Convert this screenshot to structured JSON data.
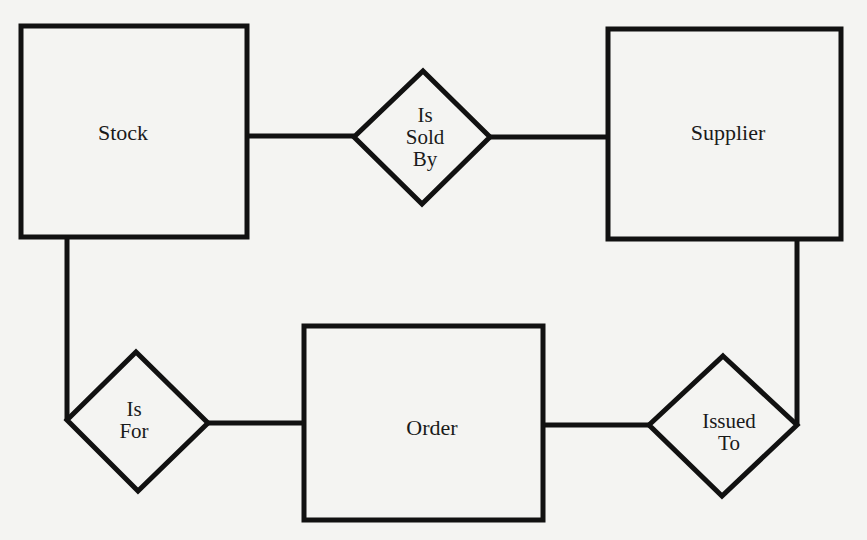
{
  "diagram": {
    "type": "entity-relationship",
    "colors": {
      "stroke": "#111111",
      "background": "#f4f4f2",
      "text": "#1a1a1a"
    },
    "entities": [
      {
        "id": "stock",
        "label": "Stock",
        "x": 20,
        "y": 25,
        "w": 227,
        "h": 212
      },
      {
        "id": "supplier",
        "label": "Supplier",
        "x": 608,
        "y": 28,
        "w": 234,
        "h": 212
      },
      {
        "id": "order",
        "label": "Order",
        "x": 303,
        "y": 325,
        "w": 241,
        "h": 195
      }
    ],
    "relationships": [
      {
        "id": "is-sold-by",
        "label": "Is\nSold\nBy",
        "cx": 422,
        "cy": 137,
        "rx": 68,
        "ry": 66
      },
      {
        "id": "is-for",
        "label": "Is\nFor",
        "cx": 137,
        "cy": 423,
        "rx": 70,
        "ry": 70
      },
      {
        "id": "issued-to",
        "label": "Issued\nTo",
        "cx": 722,
        "cy": 425,
        "rx": 73,
        "ry": 70
      }
    ],
    "connections": [
      {
        "from": "stock",
        "to": "is-sold-by"
      },
      {
        "from": "is-sold-by",
        "to": "supplier"
      },
      {
        "from": "stock",
        "to": "is-for"
      },
      {
        "from": "is-for",
        "to": "order"
      },
      {
        "from": "order",
        "to": "issued-to"
      },
      {
        "from": "issued-to",
        "to": "supplier"
      }
    ]
  },
  "labels": {
    "stock": "Stock",
    "supplier": "Supplier",
    "order": "Order",
    "is_sold_by": "Is\nSold\nBy",
    "is_for": "Is\nFor",
    "issued_to": "Issued\nTo"
  }
}
